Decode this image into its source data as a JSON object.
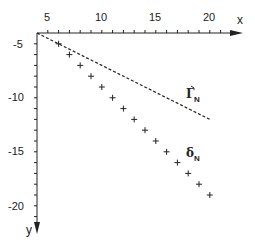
{
  "chart_data": {
    "type": "scatter",
    "title": "",
    "xlabel": "x",
    "ylabel": "y",
    "xlim": [
      4,
      22
    ],
    "ylim": [
      -22,
      -4
    ],
    "x_axis_position": "top",
    "y_axis_direction": "downward",
    "grid": false,
    "x_ticks": [
      5,
      10,
      15,
      20
    ],
    "y_ticks": [
      -5,
      -10,
      -15,
      -20
    ],
    "x_minor_tick_step": 1,
    "y_minor_tick_step": 1,
    "series": [
      {
        "name": "Γ_N",
        "label_main": "Γ",
        "label_sub": "N",
        "style": "dashed-line",
        "x": [
          4,
          20
        ],
        "y": [
          -4,
          -12
        ]
      },
      {
        "name": "δ_N",
        "label_main": "δ",
        "label_sub": "N",
        "style": "plus-markers",
        "x": [
          6,
          7,
          8,
          9,
          10,
          11,
          12,
          13,
          14,
          15,
          16,
          17,
          18,
          19,
          20
        ],
        "y": [
          -5,
          -6,
          -7,
          -8,
          -9,
          -10,
          -11,
          -12,
          -13,
          -14,
          -15,
          -16,
          -17,
          -18,
          -19
        ]
      }
    ],
    "annotations": [
      {
        "text": "Γ_N",
        "x": 19,
        "y": -9.5
      },
      {
        "text": "δ_N",
        "x": 19,
        "y": -15
      }
    ]
  },
  "labels": {
    "x_axis": "x",
    "y_axis": "y",
    "x_ticks": [
      "5",
      "10",
      "15",
      "20"
    ],
    "y_ticks": [
      "-5",
      "-10",
      "-15",
      "-20"
    ],
    "gamma_main": "Γ",
    "gamma_sub": "N",
    "delta_main": "δ",
    "delta_sub": "N"
  },
  "colors": {
    "ink": "#222222",
    "background": "#ffffff"
  }
}
